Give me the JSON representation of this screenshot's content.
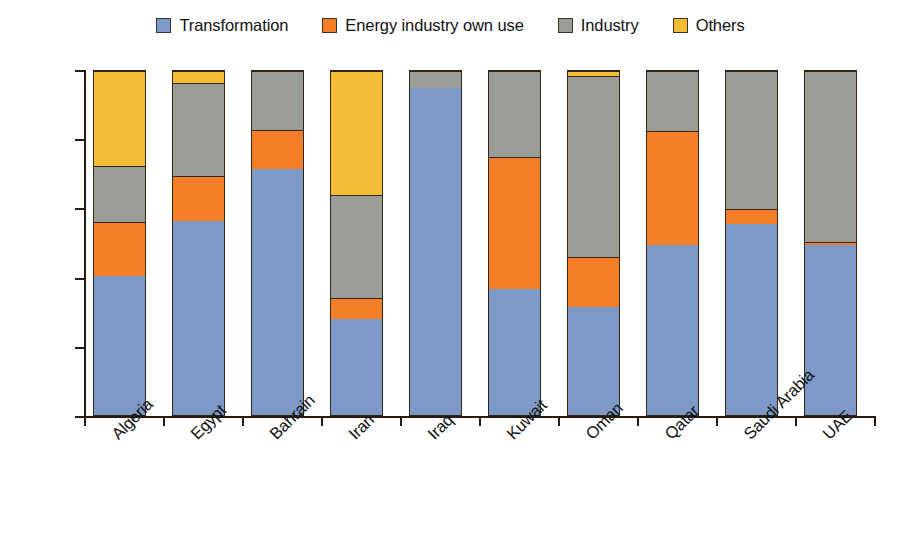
{
  "legend": {
    "items": [
      {
        "label": "Transformation",
        "color": "#7c99c8",
        "key": "transformation"
      },
      {
        "label": "Energy industry own use",
        "color": "#f47f28",
        "key": "energy"
      },
      {
        "label": "Industry",
        "color": "#9c9c97",
        "key": "industry"
      },
      {
        "label": "Others",
        "color": "#f5bd35",
        "key": "others"
      }
    ]
  },
  "axes": {
    "y_ticks": [
      "0%",
      "20%",
      "40%",
      "60%",
      "80%",
      "100%"
    ],
    "y_tick_values": [
      0,
      20,
      40,
      60,
      80,
      100
    ]
  },
  "chart_data": {
    "type": "bar",
    "stacked": true,
    "normalized": true,
    "title": "",
    "xlabel": "",
    "ylabel": "",
    "ylim": [
      0,
      100
    ],
    "grid": false,
    "legend_position": "top-center",
    "categories": [
      "Algeria",
      "Egypt",
      "Bahrain",
      "Iran",
      "Iraq",
      "Kuwait",
      "Oman",
      "Qatar",
      "Saudi Arabia",
      "UAE"
    ],
    "series": [
      {
        "name": "Transformation",
        "color": "#7c99c8",
        "values": [
          40.5,
          56.5,
          71.5,
          28.0,
          95.0,
          36.5,
          31.5,
          49.5,
          55.5,
          49.5
        ]
      },
      {
        "name": "Energy industry own use",
        "color": "#f47f28",
        "values": [
          15.5,
          13.0,
          11.5,
          6.0,
          0.0,
          38.5,
          14.5,
          33.0,
          4.5,
          0.8
        ]
      },
      {
        "name": "Industry",
        "color": "#9c9c97",
        "values": [
          16.5,
          27.0,
          17.0,
          30.0,
          5.0,
          25.0,
          52.5,
          17.5,
          40.0,
          49.7
        ]
      },
      {
        "name": "Others",
        "color": "#f5bd35",
        "values": [
          27.5,
          3.5,
          0.0,
          36.0,
          0.0,
          0.0,
          1.5,
          0.0,
          0.0,
          0.0
        ]
      }
    ]
  }
}
